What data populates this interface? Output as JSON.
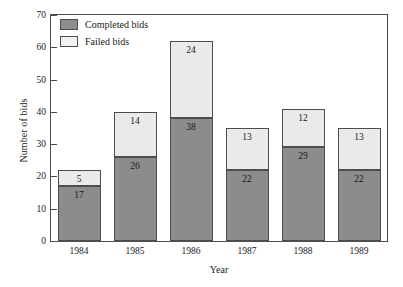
{
  "chart_data": {
    "type": "bar",
    "subtype": "stacked-vertical",
    "title": "",
    "xlabel": "Year",
    "ylabel": "Number of bids",
    "categories": [
      "1984",
      "1985",
      "1986",
      "1987",
      "1988",
      "1989"
    ],
    "series": [
      {
        "name": "Completed bids",
        "color": "#8c8c8c",
        "values": [
          17,
          26,
          38,
          22,
          29,
          22
        ]
      },
      {
        "name": "Failed bids",
        "color": "#eaeaea",
        "values": [
          5,
          14,
          24,
          13,
          12,
          13
        ]
      }
    ],
    "totals": [
      22,
      40,
      62,
      35,
      41,
      35
    ],
    "ylim": [
      0,
      70
    ],
    "yticks": [
      0,
      10,
      20,
      30,
      40,
      50,
      60,
      70
    ],
    "ytick_labels": [
      "0",
      "10",
      "20",
      "30",
      "40",
      "50",
      "60",
      "70"
    ],
    "grid": false,
    "legend_position": "top-left",
    "legend_entries": [
      "Completed bids",
      "Failed bids"
    ],
    "data_labels_shown": true
  },
  "axes": {
    "y_title": "Number of bids",
    "x_title": "Year"
  },
  "legend": {
    "items": [
      {
        "label": "Completed bids",
        "swatch": "dark-gray-swatch"
      },
      {
        "label": "Failed bids",
        "swatch": "light-gray-swatch"
      }
    ]
  }
}
